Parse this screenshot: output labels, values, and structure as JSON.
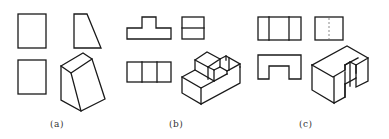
{
  "figure": {
    "panels": [
      {
        "id": "a",
        "label": "(a)",
        "description": "Two rectangular views, a trapezoid view, and an isometric wedge"
      },
      {
        "id": "b",
        "label": "(b)",
        "description": "T-shaped front view, divided rectangle side view, three-cell top view, and isometric stepped block"
      },
      {
        "id": "c",
        "label": "(c)",
        "description": "Three-cell front view, side view with dashed hidden line, U-shaped top view, and isometric U-block"
      }
    ],
    "colors": {
      "line": "#1a1a1a",
      "hidden_line": "#8a8a8a",
      "background": "#ffffff"
    }
  }
}
